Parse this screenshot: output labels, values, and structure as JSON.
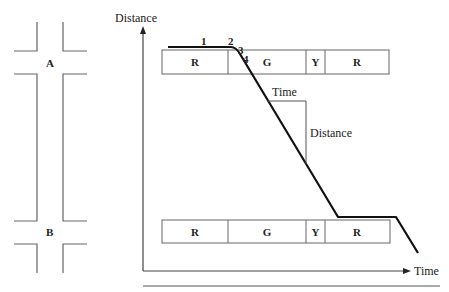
{
  "intersections": [
    {
      "label": "A",
      "name": "intersection-a"
    },
    {
      "label": "B",
      "name": "intersection-b"
    }
  ],
  "axes": {
    "y_label": "Distance",
    "x_label": "Time"
  },
  "signal_bars": {
    "upper": [
      "R",
      "G",
      "Y",
      "R"
    ],
    "lower": [
      "R",
      "G",
      "Y",
      "R"
    ]
  },
  "trajectory_points": [
    "1",
    "2",
    "3",
    "4"
  ],
  "slope_triangle": {
    "time_label": "Time",
    "distance_label": "Distance"
  }
}
